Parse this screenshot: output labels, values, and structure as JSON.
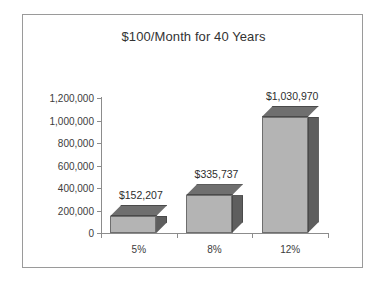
{
  "chart_data": {
    "type": "bar",
    "title": "$100/Month for 40 Years",
    "xlabel": "",
    "ylabel": "",
    "categories": [
      "5%",
      "8%",
      "12%"
    ],
    "values": [
      152207,
      335737,
      1030970
    ],
    "data_labels": [
      "$152,207",
      "$335,737",
      "$1,030,970"
    ],
    "ylim": [
      0,
      1200000
    ],
    "ytick_values": [
      0,
      200000,
      400000,
      600000,
      800000,
      1000000,
      1200000
    ],
    "ytick_labels": [
      "0",
      "200,000",
      "400,000",
      "600,000",
      "800,000",
      "1,000,000",
      "1,200,000"
    ],
    "grid": false,
    "legend": false,
    "style": "3d-column",
    "colors": {
      "bar_front": "#b4b4b4",
      "bar_side": "#5e5e5e",
      "bar_top": "#6f6f6f",
      "bar_outline": "#6e6e6e",
      "axis": "#8c8c8c",
      "frame": "#9a9a9a",
      "text": "#3c3c3c",
      "background": "#ffffff"
    }
  }
}
